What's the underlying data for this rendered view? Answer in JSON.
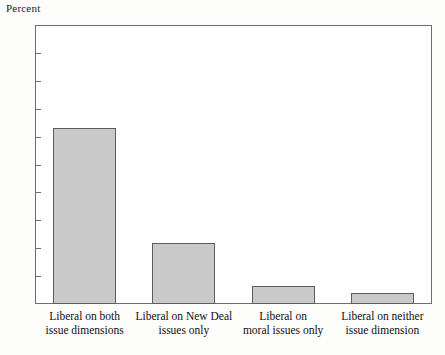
{
  "chart_data": {
    "type": "bar",
    "title": "",
    "ylabel": "Percent",
    "xlabel": "",
    "ylim": [
      0,
      100
    ],
    "yticks": [
      10,
      20,
      30,
      40,
      50,
      60,
      70,
      80,
      90
    ],
    "ytick_labels": [
      "10",
      "20",
      "30",
      "40",
      "50",
      "60",
      "70",
      "80",
      "90"
    ],
    "grid": false,
    "legend": null,
    "categories": [
      "Liberal on both\nissue dimensions",
      "Liberal on New Deal\nissues only",
      "Liberal on\nmoral issues only",
      "Liberal on neither\nissue dimension"
    ],
    "values": [
      63,
      22,
      6.5,
      4
    ],
    "bar_color": "#c9c9c9",
    "bar_edge_color": "#5d5d5d",
    "axis_color": "#6d6d6d"
  }
}
